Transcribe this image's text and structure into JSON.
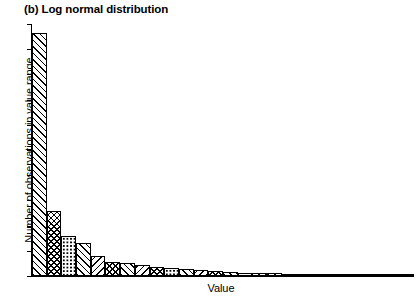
{
  "figure": {
    "title": "(b) Log normal distribution",
    "panel_label": "(b)"
  },
  "axes": {
    "xlabel": "Value",
    "ylabel": "Number of observations in value range",
    "x_tick_labels": [],
    "y_tick_labels": [],
    "y_tick_count": 10,
    "grid": false
  },
  "colors": {
    "foreground": "#000000",
    "background": "#ffffff",
    "bar_fill": "#ffffff",
    "bar_edge": "#000000"
  },
  "chart_data": {
    "type": "bar",
    "title": "(b) Log normal distribution",
    "subtitle": "",
    "xlabel": "Value",
    "ylabel": "Number of observations in value range",
    "orientation": "vertical",
    "grid": false,
    "legend": null,
    "xlim": [
      0,
      40
    ],
    "ylim": [
      0,
      100
    ],
    "axis_tick_labels_shown": false,
    "categories": [
      "bin-1",
      "bin-2",
      "bin-3",
      "bin-4",
      "bin-5",
      "bin-6",
      "bin-7",
      "bin-8",
      "bin-9",
      "bin-10",
      "bin-11",
      "bin-12",
      "bin-13",
      "bin-14",
      "bin-15",
      "bin-16",
      "bin-17",
      "bin-18",
      "bin-19",
      "bin-20",
      "bin-21",
      "bin-22",
      "bin-23",
      "bin-24",
      "bin-25",
      "bin-26"
    ],
    "values": [
      97,
      26,
      16,
      13,
      8,
      5.5,
      5,
      4.5,
      3.5,
      3.2,
      2.8,
      2.2,
      1.8,
      1.6,
      1.4,
      1.2,
      1.1,
      1.0,
      0.9,
      0.8,
      0.7,
      0.6,
      0.55,
      0.5,
      0.45,
      0.4
    ],
    "bar_patterns": [
      "diagonal",
      "crosshatch",
      "dots",
      "diagonal",
      "back-diagonal",
      "crosshatch",
      "diagonal",
      "back-diagonal",
      "crosshatch",
      "dots",
      "diagonal",
      "back-diagonal",
      "crosshatch",
      "diagonal",
      "dots",
      "back-diagonal",
      "diagonal",
      "crosshatch",
      "horizontal",
      "diagonal",
      "dots",
      "back-diagonal",
      "crosshatch",
      "diagonal",
      "horizontal",
      "diagonal"
    ]
  }
}
